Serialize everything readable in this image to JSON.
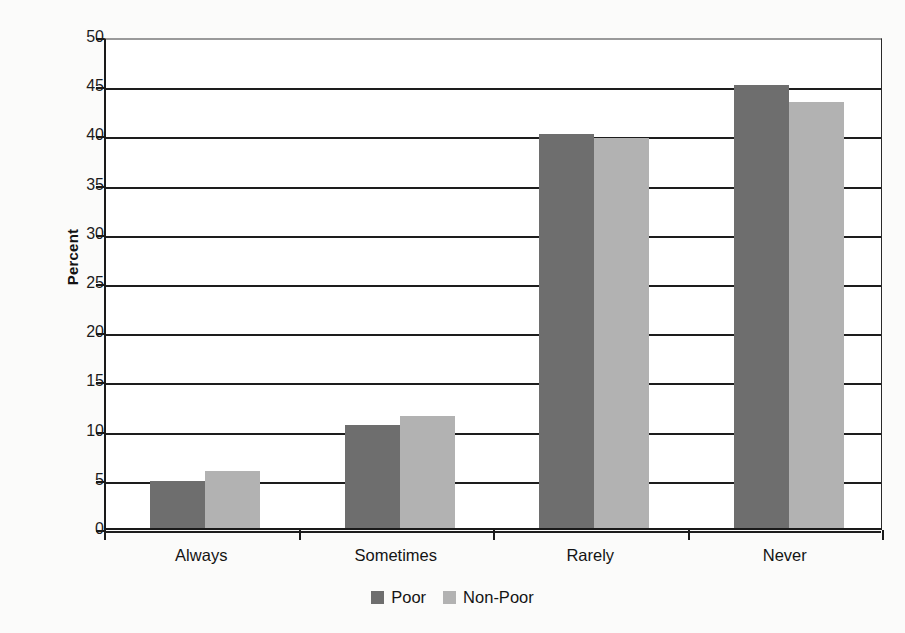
{
  "chart_data": {
    "type": "bar",
    "title": "",
    "subtitle": "",
    "xlabel": "",
    "ylabel": "Percent",
    "ylim": [
      0,
      50
    ],
    "ytick_step": 5,
    "yticks": [
      0,
      5,
      10,
      15,
      20,
      25,
      30,
      35,
      40,
      45,
      50
    ],
    "grid": true,
    "grid_axis": "y",
    "legend_position": "bottom-center",
    "categories": [
      "Always",
      "Sometimes",
      "Rarely",
      "Never"
    ],
    "series": [
      {
        "name": "Poor",
        "color": "#6e6e6e",
        "values": [
          4.8,
          10.5,
          40.0,
          45.0
        ]
      },
      {
        "name": "Non-Poor",
        "color": "#b2b2b2",
        "values": [
          5.8,
          11.4,
          39.6,
          43.3
        ]
      }
    ]
  },
  "axis": {
    "y_title": "Percent",
    "y_tick_labels": [
      "0",
      "5",
      "10",
      "15",
      "20",
      "25",
      "30",
      "35",
      "40",
      "45",
      "50"
    ],
    "x_tick_labels": [
      "Always",
      "Sometimes",
      "Rarely",
      "Never"
    ]
  },
  "legend": {
    "items": [
      {
        "label": "Poor",
        "color": "#6e6e6e",
        "swatch": "square-swatch-dark"
      },
      {
        "label": "Non-Poor",
        "color": "#b2b2b2",
        "swatch": "square-swatch-light"
      }
    ]
  },
  "colors": {
    "poor": "#6e6e6e",
    "non_poor": "#b2b2b2",
    "axis": "#1a1a1a",
    "gridline": "#1d1d1d",
    "background": "#fbfbfa",
    "plot_background": "#ffffff"
  }
}
